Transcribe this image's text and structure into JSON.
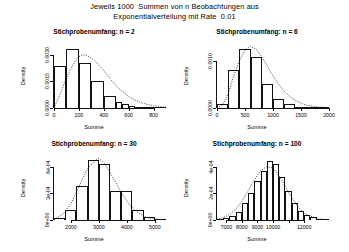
{
  "figure": {
    "title_line1": "Jeweils 1000  Summen von n Beobachtungen aus",
    "title_line2": "Exponentialverteilung mit Rate  0.01",
    "axis_label_x": "Summe",
    "axis_label_y": "Density"
  },
  "chart_data": [
    {
      "type": "bar",
      "title": "Stichprobenumfang: n = 2",
      "xlabel": "Summe",
      "ylabel": "Density",
      "xlim": [
        0,
        900
      ],
      "ylim": [
        0,
        0.0036
      ],
      "xticks": [
        0,
        200,
        400,
        600,
        800
      ],
      "xticklabels": [
        "0",
        "200",
        "400",
        "600",
        "800"
      ],
      "yticks": [
        0,
        0.0015,
        0.003
      ],
      "yticklabels": [
        "0.0000",
        "0.0015",
        "0.0030"
      ],
      "grid": false,
      "bin_edges": [
        0,
        100,
        200,
        300,
        400,
        500,
        550,
        600,
        650,
        700,
        750,
        800,
        850,
        900
      ],
      "values": [
        0.00235,
        0.0033,
        0.00255,
        0.0015,
        0.0007,
        0.00032,
        0.00022,
        0.00012,
        8e-05,
        5e-05,
        3e-05,
        2e-05,
        1e-05
      ],
      "overlay": {
        "name": "theoretische Dichte",
        "style": "dotted",
        "x": [
          0,
          50,
          100,
          150,
          200,
          250,
          300,
          350,
          400,
          450,
          500,
          550,
          600,
          650,
          700,
          750,
          800,
          850,
          900
        ],
        "y": [
          0.0,
          0.0008,
          0.0017,
          0.0024,
          0.0029,
          0.003,
          0.00283,
          0.0025,
          0.0021,
          0.00165,
          0.00125,
          0.00092,
          0.00065,
          0.00045,
          0.0003,
          0.0002,
          0.00013,
          8e-05,
          5e-05
        ]
      }
    },
    {
      "type": "bar",
      "title": "Stichprobenumfang: n = 6",
      "xlabel": "Summe",
      "ylabel": "Density",
      "xlim": [
        0,
        2000
      ],
      "ylim": [
        0,
        0.00135
      ],
      "xticks": [
        0,
        500,
        1000,
        1500,
        2000
      ],
      "xticklabels": [
        "0",
        "500",
        "1000",
        "1500",
        "2000"
      ],
      "yticks": [
        0,
        0.001
      ],
      "yticklabels": [
        "0.0000",
        "0.0010"
      ],
      "grid": false,
      "bin_edges": [
        0,
        200,
        400,
        600,
        800,
        1000,
        1200,
        1400,
        1600,
        1800,
        2000
      ],
      "values": [
        8e-05,
        0.0008,
        0.00125,
        0.00108,
        0.0005,
        0.0002,
        8e-05,
        3e-05,
        1e-05,
        5e-06
      ],
      "overlay": {
        "name": "theoretische Dichte",
        "style": "dotted",
        "x": [
          0,
          100,
          200,
          300,
          400,
          500,
          600,
          700,
          800,
          900,
          1000,
          1100,
          1200,
          1300,
          1400,
          1500,
          1600,
          1800,
          2000
        ],
        "y": [
          0.0,
          6e-05,
          0.0003,
          0.00068,
          0.001,
          0.00122,
          0.0013,
          0.00124,
          0.00108,
          0.00088,
          0.00068,
          0.0005,
          0.00035,
          0.00024,
          0.00016,
          0.0001,
          6e-05,
          2e-05,
          1e-05
        ]
      }
    },
    {
      "type": "bar",
      "title": "Stichprobenumfang: n = 30",
      "xlabel": "Summe",
      "ylabel": "Density",
      "xlim": [
        1400,
        5400
      ],
      "ylim": [
        0,
        0.00072
      ],
      "xticks": [
        2000,
        3000,
        4000,
        5000
      ],
      "xticklabels": [
        "2000",
        "3000",
        "4000",
        "5000"
      ],
      "yticks": [
        0,
        0.0003,
        0.0006
      ],
      "yticklabels": [
        "0e+00",
        "3e-04",
        "6e-04"
      ],
      "grid": false,
      "bin_edges": [
        1400,
        1800,
        2200,
        2600,
        3000,
        3400,
        3800,
        4200,
        4600,
        5000,
        5400
      ],
      "values": [
        2e-05,
        0.00011,
        0.00038,
        0.00068,
        0.00063,
        0.00033,
        0.00033,
        0.00011,
        3e-05,
        5e-06
      ],
      "overlay": {
        "name": "theoretische Dichte",
        "style": "dotted",
        "x": [
          1400,
          1700,
          2000,
          2300,
          2600,
          2900,
          3000,
          3200,
          3500,
          3800,
          4100,
          4400,
          4700,
          5000,
          5400
        ],
        "y": [
          1e-05,
          6e-05,
          0.00018,
          0.00038,
          0.00058,
          0.00068,
          0.00069,
          0.00064,
          0.00048,
          0.00031,
          0.00017,
          8e-05,
          3e-05,
          1e-05,
          2e-06
        ]
      }
    },
    {
      "type": "bar",
      "title": "Stichprobenumfang: n = 100",
      "xlabel": "Summe",
      "ylabel": "Density",
      "xlim": [
        6400,
        13600
      ],
      "ylim": [
        0,
        0.00048
      ],
      "xticks": [
        7000,
        8000,
        9000,
        10000,
        11000,
        12000
      ],
      "xticklabels": [
        "7000",
        "8000",
        "9000",
        "10000",
        "",
        "12000"
      ],
      "yticks": [
        0,
        0.0002,
        0.0004
      ],
      "yticklabels": [
        "0e+00",
        "2e-04",
        "4e-04"
      ],
      "grid": false,
      "bin_edges": [
        6400,
        6800,
        7200,
        7600,
        8000,
        8400,
        8800,
        9200,
        9600,
        10000,
        10400,
        10800,
        11200,
        11600,
        12000,
        12400,
        12800,
        13200,
        13600
      ],
      "values": [
        8e-06,
        1.5e-05,
        3e-05,
        6e-05,
        0.00013,
        0.0002,
        0.00029,
        0.00037,
        0.00044,
        0.00042,
        0.00032,
        0.00022,
        0.00013,
        7e-05,
        4e-05,
        2e-05,
        1e-05,
        5e-06
      ],
      "overlay": {
        "name": "theoretische Dichte",
        "style": "dotted",
        "x": [
          6400,
          6800,
          7200,
          7600,
          8000,
          8400,
          8800,
          9200,
          9600,
          10000,
          10400,
          10800,
          11200,
          11600,
          12000,
          12400,
          12800,
          13200,
          13600
        ],
        "y": [
          6e-06,
          1.8e-05,
          4e-05,
          8e-05,
          0.00014,
          0.00022,
          0.0003,
          0.00037,
          0.0004,
          0.00039,
          0.00033,
          0.00025,
          0.00017,
          0.0001,
          5e-05,
          3e-05,
          1e-05,
          5e-06,
          2e-06
        ]
      }
    }
  ]
}
